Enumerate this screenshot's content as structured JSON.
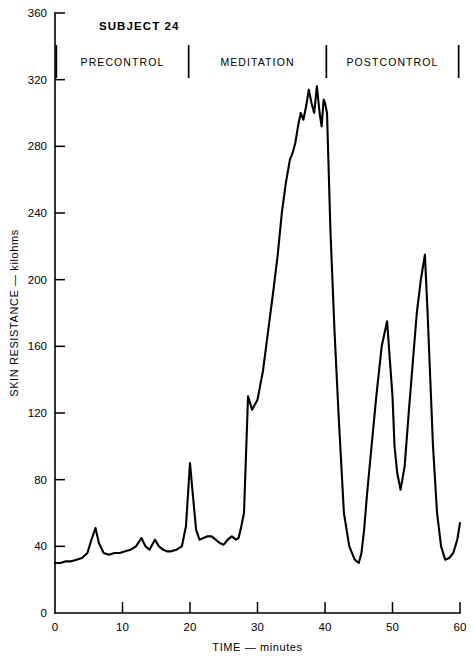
{
  "chart_data": {
    "type": "line",
    "title": "SUBJECT 24",
    "xlabel": "TIME — minutes",
    "ylabel": "SKIN RESISTANCE — kilohms",
    "xlim": [
      0,
      60
    ],
    "ylim": [
      0,
      360
    ],
    "grid": false,
    "legend": null,
    "x_ticks": [
      0,
      10,
      20,
      30,
      40,
      50,
      60
    ],
    "y_ticks": [
      0,
      40,
      80,
      120,
      160,
      200,
      240,
      280,
      320,
      360
    ],
    "x_tick_labels": [
      "0",
      "10",
      "20",
      "30",
      "40",
      "50",
      "60"
    ],
    "y_tick_labels": [
      "0",
      "40",
      "80",
      "120",
      "160",
      "200",
      "240",
      "280",
      "320",
      "360"
    ],
    "annotations": [
      {
        "label": "PRECONTROL",
        "x_center": 10.0
      },
      {
        "label": "MEDITATION",
        "x_center": 30.0
      },
      {
        "label": "POSTCONTROL",
        "x_center": 50.0
      }
    ],
    "phase_dividers": [
      0.2,
      19.8,
      40.2,
      59.8
    ],
    "series": [
      {
        "name": "Skin resistance",
        "color": "#000000",
        "x": [
          0.0,
          0.8,
          1.6,
          2.4,
          3.2,
          4.0,
          4.8,
          5.4,
          6.0,
          6.5,
          7.2,
          8.0,
          8.8,
          9.6,
          10.4,
          11.2,
          12.0,
          12.8,
          13.4,
          14.0,
          14.8,
          15.4,
          16.0,
          16.6,
          17.2,
          18.0,
          18.8,
          19.4,
          20.0,
          20.4,
          20.9,
          21.4,
          22.0,
          22.6,
          23.2,
          23.8,
          24.4,
          25.0,
          25.6,
          26.2,
          26.8,
          27.2,
          27.6,
          28.0,
          28.6,
          29.2,
          30.0,
          30.8,
          31.6,
          32.4,
          33.0,
          33.6,
          34.2,
          34.8,
          35.2,
          35.6,
          36.0,
          36.4,
          36.8,
          37.2,
          37.6,
          38.0,
          38.4,
          38.8,
          39.2,
          39.5,
          39.8,
          40.0,
          40.3,
          40.8,
          41.4,
          42.0,
          42.8,
          43.6,
          44.4,
          45.0,
          45.4,
          45.8,
          46.2,
          46.8,
          47.6,
          48.4,
          49.2,
          50.0,
          50.3,
          50.7,
          51.2,
          51.8,
          52.4,
          53.0,
          53.6,
          54.2,
          54.8,
          55.2,
          55.6,
          56.0,
          56.6,
          57.2,
          57.8,
          58.4,
          59.0,
          59.6,
          60.0
        ],
        "y": [
          30,
          30,
          31,
          31,
          32,
          33,
          36,
          44,
          51,
          42,
          36,
          35,
          36,
          36,
          37,
          38,
          40,
          45,
          40,
          38,
          44,
          40,
          38,
          37,
          37,
          38,
          40,
          52,
          90,
          72,
          50,
          44,
          45,
          46,
          46,
          44,
          42,
          41,
          44,
          46,
          44,
          45,
          52,
          60,
          130,
          122,
          128,
          145,
          170,
          195,
          215,
          240,
          258,
          272,
          276,
          282,
          292,
          300,
          296,
          304,
          314,
          306,
          300,
          316,
          300,
          292,
          308,
          306,
          300,
          230,
          170,
          120,
          60,
          40,
          32,
          30,
          36,
          50,
          70,
          96,
          130,
          160,
          175,
          130,
          100,
          84,
          74,
          88,
          120,
          150,
          180,
          200,
          215,
          180,
          140,
          100,
          60,
          40,
          32,
          33,
          36,
          44,
          54
        ]
      }
    ]
  },
  "axis_titles": {
    "x": "TIME — minutes",
    "y": "SKIN RESISTANCE — kilohms"
  },
  "header": {
    "subject": "SUBJECT 24"
  }
}
